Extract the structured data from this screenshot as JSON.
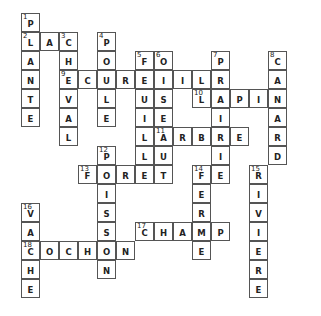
{
  "puzzle": {
    "type": "crossword",
    "cell_size": 19,
    "origin": {
      "x": 21,
      "y": 13
    },
    "words": [
      {
        "number": 1,
        "direction": "down",
        "row": 0,
        "col": 0,
        "answer": "PLANTE"
      },
      {
        "number": 2,
        "direction": "across",
        "row": 1,
        "col": 0,
        "answer": "LAC"
      },
      {
        "number": 3,
        "direction": "down",
        "row": 1,
        "col": 2,
        "answer": "CHEVAL"
      },
      {
        "number": 4,
        "direction": "down",
        "row": 1,
        "col": 4,
        "answer": "POULE"
      },
      {
        "number": 5,
        "direction": "down",
        "row": 2,
        "col": 6,
        "answer": "FEUILLE"
      },
      {
        "number": 6,
        "direction": "down",
        "row": 2,
        "col": 7,
        "answer": "OISEAU"
      },
      {
        "number": 7,
        "direction": "down",
        "row": 2,
        "col": 10,
        "answer": "PRAIRIE"
      },
      {
        "number": 8,
        "direction": "down",
        "row": 2,
        "col": 13,
        "answer": "CANARD"
      },
      {
        "number": 9,
        "direction": "across",
        "row": 3,
        "col": 2,
        "answer": "ECUREUIL"
      },
      {
        "number": 10,
        "direction": "across",
        "row": 4,
        "col": 9,
        "answer": "LAPIN"
      },
      {
        "number": 11,
        "direction": "across",
        "row": 6,
        "col": 7,
        "answer": "ARBRE"
      },
      {
        "number": 12,
        "direction": "down",
        "row": 7,
        "col": 4,
        "answer": "POISSON"
      },
      {
        "number": 13,
        "direction": "across",
        "row": 8,
        "col": 3,
        "answer": "FORET"
      },
      {
        "number": 14,
        "direction": "down",
        "row": 8,
        "col": 9,
        "answer": "FERME"
      },
      {
        "number": 15,
        "direction": "down",
        "row": 8,
        "col": 12,
        "answer": "RIVIERE"
      },
      {
        "number": 16,
        "direction": "down",
        "row": 10,
        "col": 0,
        "answer": "VACHE"
      },
      {
        "number": 17,
        "direction": "across",
        "row": 11,
        "col": 6,
        "answer": "CHAMP"
      },
      {
        "number": 18,
        "direction": "across",
        "row": 12,
        "col": 0,
        "answer": "COCHON"
      }
    ]
  }
}
